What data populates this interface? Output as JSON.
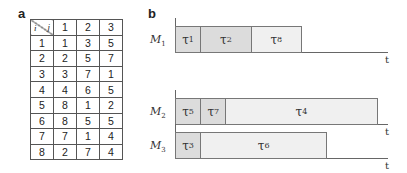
{
  "panel_a": {
    "label": "a",
    "corner": {
      "row_var": "i",
      "col_var": "j"
    },
    "columns": [
      "1",
      "2",
      "3"
    ],
    "rows": [
      {
        "i": "1",
        "values": [
          "1",
          "3",
          "5"
        ]
      },
      {
        "i": "2",
        "values": [
          "2",
          "5",
          "7"
        ]
      },
      {
        "i": "3",
        "values": [
          "3",
          "7",
          "1"
        ]
      },
      {
        "i": "4",
        "values": [
          "4",
          "6",
          "5"
        ]
      },
      {
        "i": "5",
        "values": [
          "8",
          "1",
          "2"
        ]
      },
      {
        "i": "6",
        "values": [
          "8",
          "5",
          "5"
        ]
      },
      {
        "i": "7",
        "values": [
          "7",
          "1",
          "4"
        ]
      },
      {
        "i": "8",
        "values": [
          "2",
          "7",
          "4"
        ]
      }
    ]
  },
  "panel_b": {
    "label": "b",
    "axis_label": "t",
    "colors": {
      "dark_fill": "#dcdcdc",
      "light_fill": "#f0f0f0",
      "border": "#777777"
    },
    "machines": [
      {
        "name": "M",
        "sub": "1",
        "tasks": [
          {
            "sym": "τ",
            "sub": "1",
            "start": 0,
            "duration": 1,
            "shade": "dark"
          },
          {
            "sym": "τ",
            "sub": "2",
            "start": 1,
            "duration": 2,
            "shade": "dark"
          },
          {
            "sym": "τ",
            "sub": "8",
            "start": 3,
            "duration": 2,
            "shade": "light"
          }
        ]
      },
      {
        "name": "M",
        "sub": "2",
        "tasks": [
          {
            "sym": "τ",
            "sub": "5",
            "start": 0,
            "duration": 1,
            "shade": "dark"
          },
          {
            "sym": "τ",
            "sub": "7",
            "start": 1,
            "duration": 1,
            "shade": "dark"
          },
          {
            "sym": "τ",
            "sub": "4",
            "start": 2,
            "duration": 6,
            "shade": "light"
          }
        ]
      },
      {
        "name": "M",
        "sub": "3",
        "tasks": [
          {
            "sym": "τ",
            "sub": "3",
            "start": 0,
            "duration": 1,
            "shade": "dark"
          },
          {
            "sym": "τ",
            "sub": "6",
            "start": 1,
            "duration": 5,
            "shade": "light"
          }
        ]
      }
    ]
  }
}
